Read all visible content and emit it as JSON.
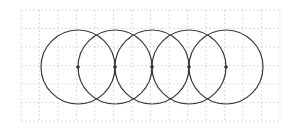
{
  "diagram": {
    "type": "overlapping-circles-on-grid",
    "grid": {
      "x0": 21,
      "y0": 10,
      "cell": 18.5,
      "cols": 14,
      "rows": 6,
      "color": "#d4d4d4",
      "dash": "2,2"
    },
    "circles": [
      {
        "cx": 78,
        "cy": 67,
        "r": 37
      },
      {
        "cx": 115,
        "cy": 67,
        "r": 37
      },
      {
        "cx": 152,
        "cy": 67,
        "r": 37
      },
      {
        "cx": 189,
        "cy": 67,
        "r": 37
      },
      {
        "cx": 226,
        "cy": 67,
        "r": 37
      }
    ],
    "stroke_color": "#3a3a3a",
    "center_dot_color": "#333333",
    "center_dot_radius": 1.8
  }
}
